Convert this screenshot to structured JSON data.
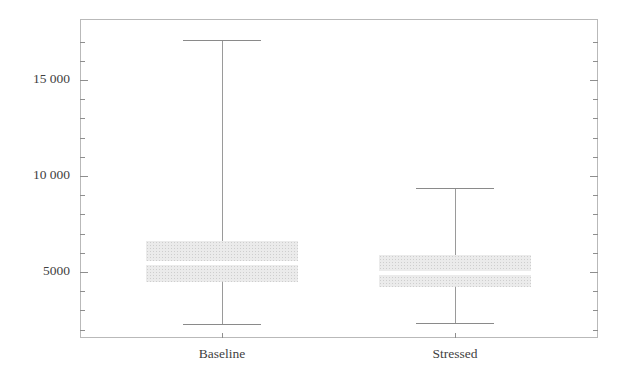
{
  "chart_data": {
    "type": "box",
    "title": "",
    "xlabel": "",
    "ylabel": "",
    "categories": [
      "Baseline",
      "Stressed"
    ],
    "ylim": [
      1000,
      17800
    ],
    "grid": false,
    "legend": null,
    "ytick_labels": [
      "5000",
      "10 000",
      "15 000"
    ],
    "ytick_values": [
      5000,
      10000,
      15000
    ],
    "minor_tick_step": 1000,
    "boxes": [
      {
        "name": "Baseline",
        "whisker_low": 2300,
        "q1": 4500,
        "median": 5450,
        "q3": 6600,
        "whisker_high": 17100
      },
      {
        "name": "Stressed",
        "whisker_low": 2350,
        "q1": 4200,
        "median": 4950,
        "q3": 5900,
        "whisker_high": 9350
      }
    ],
    "colors": {
      "box_fill": "#ebebeb",
      "median": "#ffffff",
      "whisker": "#9a9a9a",
      "frame": "#b9b9b9",
      "text": "#3f3f3f"
    }
  },
  "axis": {
    "y_tick_0": "5000",
    "y_tick_1": "10 000",
    "y_tick_2": "15 000"
  },
  "xaxis": {
    "label_0": "Baseline",
    "label_1": "Stressed"
  }
}
